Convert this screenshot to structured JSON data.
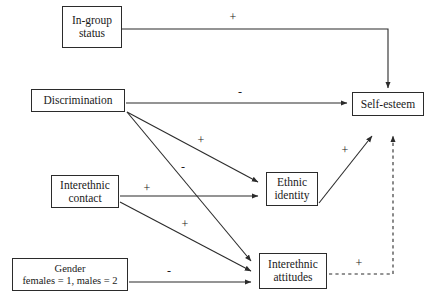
{
  "diagram": {
    "type": "path-diagram",
    "colors": {
      "stroke": "#2b2b2b",
      "text": "#1a1a1a",
      "background": "#ffffff"
    },
    "nodes": [
      {
        "id": "in-group-status",
        "lines": [
          "In-group",
          "status"
        ],
        "x": 62,
        "y": 6,
        "w": 60,
        "h": 42,
        "font_size": 11.5
      },
      {
        "id": "discrimination",
        "lines": [
          "Discrimination"
        ],
        "x": 31,
        "y": 89,
        "w": 94,
        "h": 23,
        "font_size": 11.5
      },
      {
        "id": "self-esteem",
        "lines": [
          "Self-esteem"
        ],
        "x": 352,
        "y": 92,
        "w": 72,
        "h": 24,
        "font_size": 11.5
      },
      {
        "id": "interethnic-contact",
        "lines": [
          "Interethnic",
          "contact"
        ],
        "x": 51,
        "y": 175,
        "w": 68,
        "h": 33,
        "font_size": 11.5
      },
      {
        "id": "ethnic-identity",
        "lines": [
          "Ethnic",
          "identity"
        ],
        "x": 266,
        "y": 172,
        "w": 52,
        "h": 34,
        "font_size": 11.5
      },
      {
        "id": "gender",
        "lines": [
          "Gender",
          "females = 1, males = 2"
        ],
        "x": 12,
        "y": 258,
        "w": 116,
        "h": 33,
        "font_size": 10.5
      },
      {
        "id": "interethnic-attitudes",
        "lines": [
          "Interethnic",
          "attitudes"
        ],
        "x": 259,
        "y": 253,
        "w": 68,
        "h": 36,
        "font_size": 11.5
      }
    ],
    "edges": [
      {
        "id": "in-group-status-to-self-esteem",
        "from": "in-group-status",
        "to": "self-esteem",
        "sign": "+",
        "style": "solid",
        "path": "M122,29 L388,29 L388,88"
      },
      {
        "id": "discrimination-to-self-esteem",
        "from": "discrimination",
        "to": "self-esteem",
        "sign": "-",
        "style": "solid",
        "path": "M126,103 L348,103"
      },
      {
        "id": "discrimination-to-ethnic-identity",
        "from": "discrimination",
        "to": "ethnic-identity",
        "sign": "+",
        "style": "solid",
        "path": "M126,112 L259,182"
      },
      {
        "id": "discrimination-to-interethnic-attitudes",
        "from": "discrimination",
        "to": "interethnic-attitudes",
        "sign": "-",
        "style": "solid",
        "path": "M126,112 L252,261"
      },
      {
        "id": "interethnic-contact-to-ethnic-identity",
        "from": "interethnic-contact",
        "to": "ethnic-identity",
        "sign": "+",
        "style": "solid",
        "path": "M120,196 L259,196"
      },
      {
        "id": "interethnic-contact-to-interethnic-attitudes",
        "from": "interethnic-contact",
        "to": "interethnic-attitudes",
        "sign": "+",
        "style": "solid",
        "path": "M120,202 L252,271"
      },
      {
        "id": "gender-to-interethnic-attitudes",
        "from": "gender",
        "to": "interethnic-attitudes",
        "sign": "-",
        "style": "solid",
        "path": "M129,282 L252,282"
      },
      {
        "id": "ethnic-identity-to-self-esteem",
        "from": "ethnic-identity",
        "to": "self-esteem",
        "sign": "+",
        "style": "solid",
        "path": "M319,203 L373,135"
      },
      {
        "id": "interethnic-attitudes-to-self-esteem",
        "from": "interethnic-attitudes",
        "to": "self-esteem",
        "sign": "+",
        "style": "dashed",
        "path": "M329,274 L393,274 L393,135"
      }
    ],
    "sign_labels": [
      {
        "id": "sign-in-group-status",
        "text": "+",
        "x": 232,
        "y": 17
      },
      {
        "id": "sign-discrimination-self-esteem",
        "text": "-",
        "x": 239,
        "y": 92
      },
      {
        "id": "sign-discrimination-ethnic-identity",
        "text": "+",
        "x": 200,
        "y": 140
      },
      {
        "id": "sign-discrimination-interethnic-attitudes",
        "text": "-",
        "x": 182,
        "y": 167
      },
      {
        "id": "sign-contact-ethnic-identity",
        "text": "+",
        "x": 146,
        "y": 188
      },
      {
        "id": "sign-contact-interethnic-attitudes",
        "text": "+",
        "x": 184,
        "y": 224
      },
      {
        "id": "sign-gender-interethnic-attitudes",
        "text": "-",
        "x": 168,
        "y": 271
      },
      {
        "id": "sign-ethnic-identity-self-esteem",
        "text": "+",
        "x": 344,
        "y": 150
      },
      {
        "id": "sign-interethnic-attitudes-self-esteem",
        "text": "+",
        "x": 358,
        "y": 263
      }
    ]
  }
}
